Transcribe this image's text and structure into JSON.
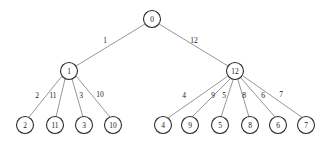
{
  "figure": {
    "kind": "tree-diagram",
    "background_color": "#ffffff",
    "node_stroke_color": "#2b2b2b",
    "node_fill_color": "#ffffff",
    "edge_stroke_color": "#8a8a8a",
    "text_color": "#1a1a1a",
    "width": 330,
    "height": 143
  },
  "nodes": [
    {
      "id": "root",
      "label": "0",
      "cx": 152,
      "cy": 19,
      "r": 8.5,
      "level": 0
    },
    {
      "id": "n1",
      "label": "1",
      "cx": 69,
      "cy": 71,
      "r": 8.5,
      "level": 1
    },
    {
      "id": "n12",
      "label": "12",
      "cx": 235,
      "cy": 71,
      "r": 8.5,
      "level": 1
    },
    {
      "id": "n2",
      "label": "2",
      "cx": 25,
      "cy": 125,
      "r": 8.5,
      "level": 2
    },
    {
      "id": "n11",
      "label": "11",
      "cx": 55,
      "cy": 125,
      "r": 8.5,
      "level": 2
    },
    {
      "id": "n3",
      "label": "3",
      "cx": 84,
      "cy": 125,
      "r": 8.5,
      "level": 2
    },
    {
      "id": "n10",
      "label": "10",
      "cx": 113,
      "cy": 125,
      "r": 8.5,
      "level": 2
    },
    {
      "id": "n4",
      "label": "4",
      "cx": 163,
      "cy": 125,
      "r": 8.5,
      "level": 2
    },
    {
      "id": "n9",
      "label": "9",
      "cx": 190,
      "cy": 125,
      "r": 8.5,
      "level": 2
    },
    {
      "id": "n5",
      "label": "5",
      "cx": 220,
      "cy": 125,
      "r": 8.5,
      "level": 2
    },
    {
      "id": "n8",
      "label": "8",
      "cx": 250,
      "cy": 125,
      "r": 8.5,
      "level": 2
    },
    {
      "id": "n6",
      "label": "6",
      "cx": 278,
      "cy": 125,
      "r": 8.5,
      "level": 2
    },
    {
      "id": "n7",
      "label": "7",
      "cx": 306,
      "cy": 125,
      "r": 8.5,
      "level": 2
    }
  ],
  "edges": [
    {
      "from": "root",
      "to": "n1",
      "label": "1",
      "x1": 145,
      "y1": 24,
      "x2": 76,
      "y2": 66,
      "lx": 105,
      "ly": 40
    },
    {
      "from": "root",
      "to": "n12",
      "label": "12",
      "x1": 159,
      "y1": 24,
      "x2": 228,
      "y2": 66,
      "lx": 194,
      "ly": 40
    },
    {
      "from": "n1",
      "to": "n2",
      "label": "2",
      "x1": 62,
      "y1": 76,
      "x2": 29,
      "y2": 117,
      "lx": 37,
      "ly": 95
    },
    {
      "from": "n1",
      "to": "n11",
      "label": "11",
      "x1": 65,
      "y1": 79,
      "x2": 56,
      "y2": 117,
      "lx": 53,
      "ly": 95
    },
    {
      "from": "n1",
      "to": "n3",
      "label": "3",
      "x1": 72,
      "y1": 79,
      "x2": 83,
      "y2": 117,
      "lx": 81,
      "ly": 95
    },
    {
      "from": "n1",
      "to": "n10",
      "label": "10",
      "x1": 76,
      "y1": 76,
      "x2": 110,
      "y2": 117,
      "lx": 100,
      "ly": 94
    },
    {
      "from": "n12",
      "to": "n4",
      "label": "4",
      "x1": 228,
      "y1": 76,
      "x2": 168,
      "y2": 118,
      "lx": 184,
      "ly": 95
    },
    {
      "from": "n12",
      "to": "n9",
      "label": "9",
      "x1": 230,
      "y1": 79,
      "x2": 192,
      "y2": 117,
      "lx": 213,
      "ly": 95
    },
    {
      "from": "n12",
      "to": "n5",
      "label": "5",
      "x1": 233,
      "y1": 80,
      "x2": 221,
      "y2": 117,
      "lx": 224,
      "ly": 95
    },
    {
      "from": "n12",
      "to": "n8",
      "label": "8",
      "x1": 238,
      "y1": 80,
      "x2": 249,
      "y2": 117,
      "lx": 244,
      "ly": 95
    },
    {
      "from": "n12",
      "to": "n6",
      "label": "6",
      "x1": 241,
      "y1": 78,
      "x2": 275,
      "y2": 117,
      "lx": 263,
      "ly": 95
    },
    {
      "from": "n12",
      "to": "n7",
      "label": "7",
      "x1": 243,
      "y1": 76,
      "x2": 303,
      "y2": 118,
      "lx": 281,
      "ly": 94
    }
  ],
  "chart_data": {
    "type": "diagram",
    "title": "",
    "structure": "rooted-tree",
    "root": "0",
    "tree": {
      "node": "0",
      "children": [
        {
          "node": "1",
          "edge_weight": "1",
          "children": [
            {
              "node": "2",
              "edge_weight": "2",
              "children": []
            },
            {
              "node": "11",
              "edge_weight": "11",
              "children": []
            },
            {
              "node": "3",
              "edge_weight": "3",
              "children": []
            },
            {
              "node": "10",
              "edge_weight": "10",
              "children": []
            }
          ]
        },
        {
          "node": "12",
          "edge_weight": "12",
          "children": [
            {
              "node": "4",
              "edge_weight": "4",
              "children": []
            },
            {
              "node": "9",
              "edge_weight": "9",
              "children": []
            },
            {
              "node": "5",
              "edge_weight": "5",
              "children": []
            },
            {
              "node": "8",
              "edge_weight": "8",
              "children": []
            },
            {
              "node": "6",
              "edge_weight": "6",
              "children": []
            },
            {
              "node": "7",
              "edge_weight": "7",
              "children": []
            }
          ]
        }
      ]
    },
    "node_labels": [
      "0",
      "1",
      "12",
      "2",
      "11",
      "3",
      "10",
      "4",
      "9",
      "5",
      "8",
      "6",
      "7"
    ],
    "edge_labels": [
      "1",
      "12",
      "2",
      "11",
      "3",
      "10",
      "4",
      "9",
      "5",
      "8",
      "6",
      "7"
    ]
  }
}
